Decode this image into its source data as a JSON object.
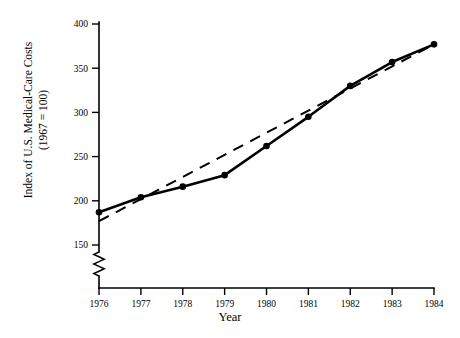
{
  "figure": {
    "background_color": "#ffffff",
    "ink_color": "#000000"
  },
  "axes": {
    "y_title_line1": "Index of U.S. Medical-Care Costs",
    "y_title_line2": "(1967 = 100)",
    "x_title": "Year",
    "y_ticks": [
      "150",
      "200",
      "250",
      "300",
      "350",
      "400"
    ],
    "x_ticks": [
      "1976",
      "1977",
      "1978",
      "1979",
      "1980",
      "1981",
      "1982",
      "1983",
      "1984"
    ],
    "y_axis_break": true
  },
  "chart_data": {
    "type": "line",
    "title": "",
    "subtitle": "",
    "xlabel": "Year",
    "ylabel": "Index of U.S. Medical-Care Costs (1967 = 100)",
    "x": [
      1976,
      1977,
      1978,
      1979,
      1980,
      1981,
      1982,
      1983,
      1984
    ],
    "categories": [
      "1976",
      "1977",
      "1978",
      "1979",
      "1980",
      "1981",
      "1982",
      "1983",
      "1984"
    ],
    "series": [
      {
        "name": "Observed index",
        "style": "solid",
        "markers": true,
        "values": [
          187,
          204,
          216,
          229,
          262,
          295,
          330,
          357,
          377
        ]
      },
      {
        "name": "Linear trend",
        "style": "dashed",
        "markers": false,
        "values": [
          177,
          202,
          227,
          252,
          277,
          302,
          327,
          352,
          377
        ]
      }
    ],
    "xlim": [
      1976,
      1984
    ],
    "ylim": [
      150,
      400
    ],
    "ylim_display_break_below": 150,
    "grid": false,
    "legend": "none"
  }
}
